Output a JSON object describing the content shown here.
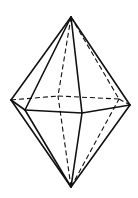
{
  "figure": {
    "title": "",
    "stroke_color": "#111111",
    "background": "#ffffff"
  },
  "vertices": {
    "top_apex": [
      71,
      17
    ],
    "bottom_apex": [
      71,
      187
    ],
    "left": [
      11,
      100
    ],
    "front_left": [
      25,
      110
    ],
    "front_mid": [
      82,
      113
    ],
    "right": [
      130,
      105
    ],
    "back_right": [
      119,
      99
    ],
    "back_left": [
      58,
      96
    ]
  },
  "edges": {
    "solid": [
      [
        "top_apex",
        "left"
      ],
      [
        "top_apex",
        "front_left"
      ],
      [
        "top_apex",
        "front_mid"
      ],
      [
        "top_apex",
        "right"
      ],
      [
        "left",
        "front_left"
      ],
      [
        "front_left",
        "front_mid"
      ],
      [
        "front_mid",
        "right"
      ],
      [
        "bottom_apex",
        "left"
      ],
      [
        "bottom_apex",
        "front_left"
      ],
      [
        "bottom_apex",
        "front_mid"
      ],
      [
        "bottom_apex",
        "right"
      ]
    ],
    "dashed": [
      [
        "top_apex",
        "back_left"
      ],
      [
        "top_apex",
        "back_right"
      ],
      [
        "left",
        "back_left"
      ],
      [
        "back_left",
        "back_right"
      ],
      [
        "back_right",
        "right"
      ],
      [
        "bottom_apex",
        "back_left"
      ],
      [
        "bottom_apex",
        "back_right"
      ]
    ]
  }
}
